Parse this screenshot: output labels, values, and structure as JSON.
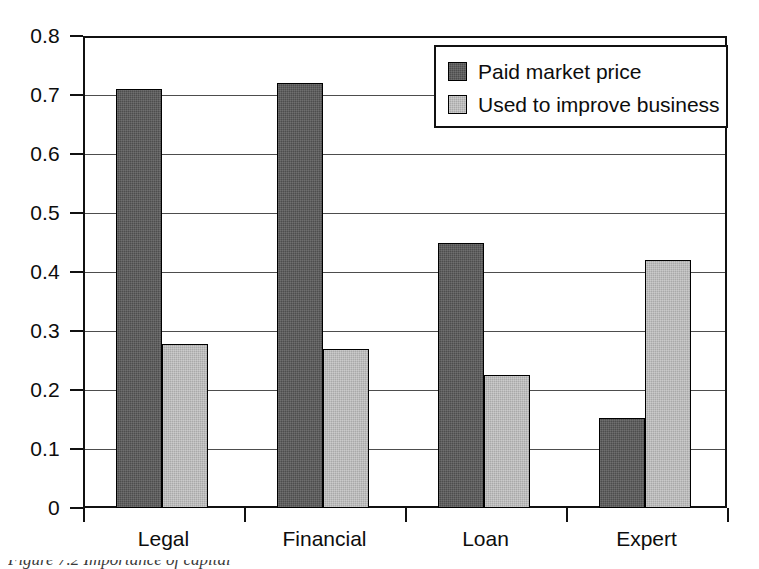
{
  "chart_data": {
    "type": "bar",
    "title": "",
    "xlabel": "",
    "ylabel": "",
    "categories": [
      "Legal",
      "Financial",
      "Loan",
      "Expert"
    ],
    "series": [
      {
        "name": "Paid market price",
        "color": "#4d4d4d",
        "values": [
          0.71,
          0.72,
          0.45,
          0.152
        ]
      },
      {
        "name": "Used to improve business",
        "color": "#a9a9a9",
        "values": [
          0.278,
          0.27,
          0.225,
          0.42
        ]
      }
    ],
    "ylim": [
      0,
      0.8
    ],
    "ytick_step": 0.1,
    "ytick_labels": [
      "0.8",
      "0.7",
      "0.6",
      "0.5",
      "0.4",
      "0.3",
      "0.2",
      "0.1",
      "0"
    ],
    "ytick_values": [
      0.8,
      0.7,
      0.6,
      0.5,
      0.4,
      0.3,
      0.2,
      0.1,
      0
    ],
    "grid": true,
    "grid_axis": "y",
    "legend_position": "top-right",
    "legend_border": true,
    "plot_border": true
  },
  "legend": {
    "entries": [
      {
        "label": "Paid market price"
      },
      {
        "label": "Used to improve business"
      }
    ]
  },
  "caption": {
    "text": "Figure 7.2  Importance of capital"
  },
  "colors": {
    "series_dark": "#4d4d4d",
    "series_light": "#a9a9a9",
    "axis": "#111111",
    "grid": "#4d4d4d",
    "background": "#ffffff",
    "text": "#0d0d0d"
  }
}
